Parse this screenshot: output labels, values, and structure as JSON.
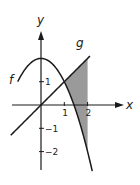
{
  "diagram": {
    "axes": {
      "x_label": "x",
      "y_label": "y"
    },
    "x_ticks": [
      {
        "value": 1,
        "label": "1"
      },
      {
        "value": 2,
        "label": "2"
      }
    ],
    "y_ticks": [
      {
        "value": 1,
        "label": "1"
      },
      {
        "value": -1,
        "label": "−1"
      },
      {
        "value": -2,
        "label": "−2"
      }
    ],
    "curves": {
      "f": {
        "label": "f",
        "expression": "2 - x^2",
        "x_range": [
          -1.0,
          2.2
        ]
      },
      "g": {
        "label": "g",
        "expression": "x",
        "x_range": [
          -1.3,
          2.1
        ]
      }
    },
    "shaded_region": {
      "between": [
        "g",
        "f"
      ],
      "x_range": [
        1,
        2
      ]
    },
    "colors": {
      "curve": "#1a1a1a",
      "shade": "#9a9a9a"
    }
  }
}
